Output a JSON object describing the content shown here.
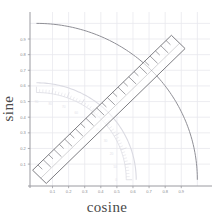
{
  "figure": {
    "kind": "unit-circle-with-ruler-overlay",
    "background_color": "#ffffff",
    "grid_color": "#e8e8ee",
    "axis_color": "#9a9aa0",
    "curve_color": "#8f8f96",
    "ruler_color": "#6e6e74",
    "protractor_color": "#dadae2",
    "label_color": "#4a4a4a"
  },
  "axes": {
    "xlabel": "cosine",
    "ylabel": "sine",
    "xlim": [
      -0.04,
      1.06
    ],
    "ylim": [
      -0.04,
      1.06
    ],
    "grid": true,
    "xticks": [
      0.1,
      0.2,
      0.3,
      0.4,
      0.5,
      0.6,
      0.7,
      0.8,
      0.9
    ],
    "yticks": [
      0.1,
      0.2,
      0.3,
      0.4,
      0.5,
      0.6,
      0.7,
      0.8,
      0.9
    ],
    "xticklabels": [
      "0.1",
      "0.2",
      "0.3",
      "0.4",
      "0.5",
      "0.6",
      "0.7",
      "0.8",
      "0.9"
    ],
    "yticklabels": [
      "0.1",
      "0.2",
      "0.3",
      "0.4",
      "0.5",
      "0.6",
      "0.7",
      "0.8",
      "0.9"
    ]
  },
  "chart_data": {
    "type": "line",
    "title": "",
    "xlabel": "cosine",
    "ylabel": "sine",
    "xlim": [
      -0.04,
      1.06
    ],
    "ylim": [
      -0.04,
      1.06
    ],
    "grid": true,
    "legend": "none",
    "series": [
      {
        "name": "unit circle (radius 1.0)",
        "kind": "arc",
        "radius": 1.0,
        "center": [
          0,
          0
        ],
        "angle_start_deg": 0,
        "angle_end_deg": 90,
        "color": "#8f8f96"
      },
      {
        "name": "protractor arc (radius 0.62)",
        "kind": "arc",
        "radius": 0.62,
        "center": [
          0,
          0
        ],
        "angle_start_deg": 0,
        "angle_end_deg": 90,
        "color": "#dadae2"
      }
    ],
    "annotations": [
      {
        "name": "ruler",
        "kind": "rotated-rectangle",
        "rotation_deg": -45,
        "length_units": 1.22,
        "width_units": 0.12,
        "tick_count": 26,
        "color": "#6e6e74"
      }
    ]
  },
  "overlays": {
    "ruler": {
      "label": "ruler",
      "rotation_deg": -45,
      "ticks": 26
    },
    "protractor": {
      "label": "protractor",
      "radius_units": 0.62,
      "degree_marks": [
        0,
        10,
        20,
        30,
        40,
        50,
        60,
        70,
        80,
        90
      ]
    }
  }
}
